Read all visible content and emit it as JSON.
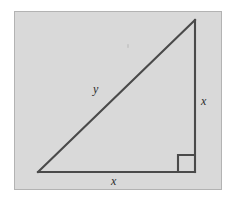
{
  "figure": {
    "background_color": "#d9d9d9",
    "frame_border_color": "#b3b3b3",
    "stroke_color": "#4a4a4a",
    "labels": {
      "hypotenuse": "y",
      "vertical_leg": "x",
      "horizontal_leg": "x"
    },
    "geometry": {
      "type": "right-triangle",
      "vertices": {
        "top_right": [
          195,
          20
        ],
        "bottom_right": [
          195,
          172
        ],
        "bottom_left": [
          38,
          172
        ]
      },
      "right_angle_at": "bottom_right",
      "right_angle_marker_size": 17,
      "legs_equal": true
    }
  }
}
